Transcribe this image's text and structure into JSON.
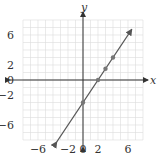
{
  "chart_data": {
    "type": "line",
    "title": "",
    "xlabel": "x",
    "ylabel": "y",
    "xlim": [
      -8,
      8
    ],
    "ylim": [
      -8,
      8
    ],
    "grid": true,
    "grid_step": 1,
    "x_ticks": [
      {
        "value": -6,
        "label": "−6"
      },
      {
        "value": -2,
        "label": "−2"
      },
      {
        "value": 0,
        "label": "0"
      },
      {
        "value": 2,
        "label": "2"
      },
      {
        "value": 6,
        "label": "6"
      }
    ],
    "y_ticks": [
      {
        "value": 6,
        "label": "6"
      },
      {
        "value": 2,
        "label": "2"
      },
      {
        "value": 0,
        "label": "0"
      },
      {
        "value": -2,
        "label": "−2"
      },
      {
        "value": -6,
        "label": "−6"
      }
    ],
    "series": [
      {
        "name": "y = 1.5x − 3",
        "equation": "y = 1.5x - 3",
        "slope": 1.5,
        "intercept": -3,
        "line_from": [
          -3.5,
          -8.25
        ],
        "line_to": [
          6.5,
          6.75
        ],
        "arrows": "both",
        "points": [
          [
            0,
            -3
          ],
          [
            2,
            0
          ],
          [
            3,
            1.5
          ],
          [
            4,
            3
          ]
        ]
      }
    ],
    "colors": {
      "line": "#555555",
      "points": "#777777",
      "grid": "#dcdcdc",
      "axis": "#333333"
    }
  }
}
